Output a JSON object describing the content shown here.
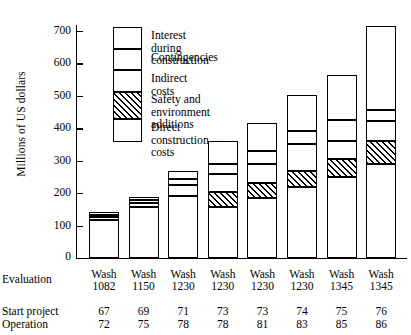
{
  "chart_data": {
    "type": "bar",
    "subtype": "stacked-bar",
    "title": "",
    "xlabel": "",
    "ylabel": "Millions of US dollars",
    "ylim": [
      0,
      740
    ],
    "yticks": [
      100,
      200,
      300,
      400,
      500,
      600,
      700
    ],
    "grid": false,
    "legend_position": "inside-top-left",
    "categories": [
      "1",
      "2",
      "3",
      "4",
      "5",
      "6",
      "7",
      "8"
    ],
    "series": [
      {
        "name": "Direct construction costs",
        "values": [
          118,
          158,
          190,
          158,
          185,
          218,
          250,
          290
        ]
      },
      {
        "name": "Safety and environment additions",
        "values": [
          0,
          0,
          0,
          45,
          45,
          50,
          55,
          72
        ]
      },
      {
        "name": "Indirect costs",
        "values": [
          8,
          12,
          35,
          55,
          60,
          85,
          55,
          60
        ]
      },
      {
        "name": "Contingencies",
        "values": [
          7,
          8,
          20,
          32,
          40,
          38,
          65,
          35
        ]
      },
      {
        "name": "Interest during construction",
        "values": [
          9,
          10,
          23,
          72,
          85,
          112,
          140,
          258
        ]
      }
    ],
    "totals": [
      142,
      188,
      268,
      362,
      415,
      503,
      565,
      715
    ],
    "legend": [
      "Interest during construction",
      "Contingencies",
      "Indirect costs",
      "Safety and environment\nadditions",
      "Direct construction costs"
    ]
  },
  "axis": {
    "y_title": "Millions of US dollars",
    "zero_label": "0",
    "ticks": [
      "700",
      "600",
      "500",
      "400",
      "300",
      "200",
      "100"
    ]
  },
  "table": {
    "rows": [
      {
        "label": "Evaluation"
      },
      {
        "label": "Start project"
      },
      {
        "label": "Operation"
      }
    ],
    "evaluation": [
      {
        "line1": "Wash",
        "line2": "1082"
      },
      {
        "line1": "Wash",
        "line2": "1150"
      },
      {
        "line1": "Wash",
        "line2": "1230"
      },
      {
        "line1": "Wash",
        "line2": "1230"
      },
      {
        "line1": "Wash",
        "line2": "1230"
      },
      {
        "line1": "Wash",
        "line2": "1230"
      },
      {
        "line1": "Wash",
        "line2": "1345"
      },
      {
        "line1": "Wash",
        "line2": "1345"
      }
    ],
    "start_project": [
      "67",
      "69",
      "71",
      "73",
      "73",
      "74",
      "75",
      "76"
    ],
    "operation": [
      "72",
      "75",
      "78",
      "78",
      "81",
      "83",
      "85",
      "86"
    ]
  },
  "colors": {
    "ink": "#000000",
    "background": "#ffffff"
  }
}
